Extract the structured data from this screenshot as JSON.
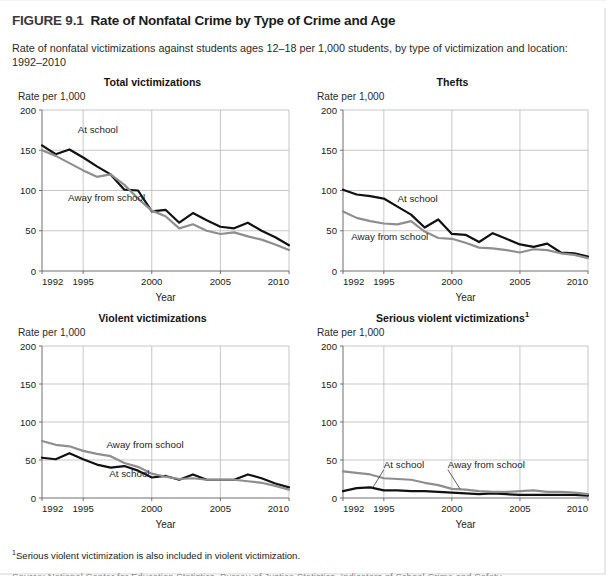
{
  "figure": {
    "number": "FIGURE 9.1",
    "title": "Rate of Nonfatal Crime by Type of Crime and Age",
    "subtitle": "Rate of nonfatal victimizations against students ages 12–18 per 1,000 students, by type of victimization and location: 1992–2010"
  },
  "footnotes": {
    "note1_marker": "1",
    "note1": "Serious violent victimization is also included in violent victimization.",
    "source_partial": "Source: National Center for Education Statistics, Bureau of Justice Statistics, Indicators of School Crime and Safety"
  },
  "colors": {
    "at_school": "#111111",
    "away_from_school": "#8e8e8e",
    "grid": "#b9b9b9",
    "axis": "#6f6f6f",
    "text": "#1a1a1a",
    "title_gray": "#3a3a3a"
  },
  "common": {
    "y_axis_label": "Rate per 1,000",
    "x_axis_label": "Year",
    "y_ticks": [
      0,
      50,
      100,
      150,
      200
    ],
    "x_ticks": [
      1992,
      1995,
      2000,
      2005,
      2010
    ],
    "ylim": [
      0,
      200
    ],
    "xlim": [
      1992,
      2010
    ],
    "series_names": [
      "At school",
      "Away from school"
    ]
  },
  "chart_data": [
    {
      "type": "line",
      "title": "Total victimizations",
      "xlabel": "Year",
      "ylabel": "Rate per 1,000",
      "ylim": [
        0,
        200
      ],
      "xlim": [
        1992,
        2010
      ],
      "grid": true,
      "legend_position": "inline-annotation",
      "x": [
        1992,
        1993,
        1994,
        1995,
        1996,
        1997,
        1998,
        1999,
        2000,
        2001,
        2002,
        2003,
        2004,
        2005,
        2006,
        2007,
        2008,
        2009,
        2010
      ],
      "series": [
        {
          "name": "At school",
          "color": "#111111",
          "values": [
            156,
            145,
            151,
            141,
            130,
            120,
            101,
            100,
            74,
            76,
            60,
            72,
            63,
            55,
            53,
            60,
            50,
            42,
            32
          ]
        },
        {
          "name": "Away from school",
          "color": "#8e8e8e",
          "values": [
            150,
            143,
            134,
            125,
            117,
            120,
            107,
            90,
            75,
            68,
            53,
            58,
            50,
            46,
            48,
            43,
            39,
            33,
            26
          ]
        }
      ],
      "annotations": [
        {
          "text": "At school",
          "x_year": 1994.6,
          "y_value": 171
        },
        {
          "text": "Away from school",
          "x_year": 1993.9,
          "y_value": 87
        }
      ]
    },
    {
      "type": "line",
      "title": "Thefts",
      "title_superscript": "",
      "xlabel": "Year",
      "ylabel": "Rate per 1,000",
      "ylim": [
        0,
        200
      ],
      "xlim": [
        1992,
        2010
      ],
      "grid": true,
      "legend_position": "inline-annotation",
      "x": [
        1992,
        1993,
        1994,
        1995,
        1996,
        1997,
        1998,
        1999,
        2000,
        2001,
        2002,
        2003,
        2004,
        2005,
        2006,
        2007,
        2008,
        2009,
        2010
      ],
      "series": [
        {
          "name": "At school",
          "color": "#111111",
          "values": [
            101,
            95,
            93,
            90,
            80,
            70,
            54,
            64,
            46,
            45,
            36,
            47,
            40,
            33,
            30,
            34,
            23,
            22,
            18
          ]
        },
        {
          "name": "Away from school",
          "color": "#8e8e8e",
          "values": [
            74,
            66,
            62,
            59,
            58,
            62,
            49,
            41,
            40,
            35,
            29,
            28,
            26,
            23,
            27,
            26,
            22,
            20,
            16
          ]
        }
      ],
      "annotations": [
        {
          "text": "At school",
          "x_year": 1996.0,
          "y_value": 86
        },
        {
          "text": "Away from school",
          "x_year": 1992.6,
          "y_value": 39
        }
      ]
    },
    {
      "type": "line",
      "title": "Violent victimizations",
      "xlabel": "Year",
      "ylabel": "Rate per 1,000",
      "ylim": [
        0,
        200
      ],
      "xlim": [
        1992,
        2010
      ],
      "grid": true,
      "legend_position": "inline-annotation",
      "x": [
        1992,
        1993,
        1994,
        1995,
        1996,
        1997,
        1998,
        1999,
        2000,
        2001,
        2002,
        2003,
        2004,
        2005,
        2006,
        2007,
        2008,
        2009,
        2010
      ],
      "series": [
        {
          "name": "At school",
          "color": "#111111",
          "values": [
            53,
            51,
            59,
            51,
            44,
            40,
            42,
            36,
            27,
            29,
            24,
            31,
            24,
            24,
            24,
            31,
            26,
            19,
            14
          ]
        },
        {
          "name": "Away from school",
          "color": "#8e8e8e",
          "values": [
            75,
            70,
            68,
            62,
            58,
            55,
            46,
            41,
            32,
            28,
            25,
            26,
            24,
            24,
            24,
            22,
            20,
            16,
            11
          ]
        }
      ],
      "annotations": [
        {
          "text": "Away from school",
          "x_year": 1996.7,
          "y_value": 66
        },
        {
          "text": "At school",
          "x_year": 1996.9,
          "y_value": 27
        }
      ]
    },
    {
      "type": "line",
      "title": "Serious violent victimizations",
      "title_superscript": "1",
      "xlabel": "Year",
      "ylabel": "Rate per 1,000",
      "ylim": [
        0,
        200
      ],
      "xlim": [
        1992,
        2010
      ],
      "grid": true,
      "legend_position": "inline-annotation",
      "x": [
        1992,
        1993,
        1994,
        1995,
        1996,
        1997,
        1998,
        1999,
        2000,
        2001,
        2002,
        2003,
        2004,
        2005,
        2006,
        2007,
        2008,
        2009,
        2010
      ],
      "series": [
        {
          "name": "At school",
          "color": "#111111",
          "values": [
            9,
            13,
            14,
            10,
            10,
            9,
            9,
            8,
            7,
            6,
            5,
            6,
            5,
            4,
            4,
            4,
            4,
            4,
            3
          ]
        },
        {
          "name": "Away from school",
          "color": "#8e8e8e",
          "values": [
            35,
            33,
            31,
            26,
            25,
            24,
            20,
            17,
            12,
            11,
            9,
            8,
            8,
            9,
            10,
            8,
            8,
            7,
            5
          ]
        }
      ],
      "annotations": [
        {
          "text": "At school",
          "x_year": 1995.0,
          "y_value": 40,
          "leader_to": {
            "x_year": 1994.2,
            "y_value": 14
          }
        },
        {
          "text": "Away from school",
          "x_year": 1999.7,
          "y_value": 40,
          "leader_to": {
            "x_year": 2000.6,
            "y_value": 12
          }
        }
      ]
    }
  ]
}
